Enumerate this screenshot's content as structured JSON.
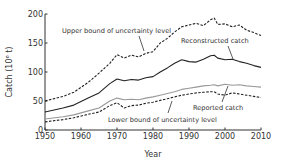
{
  "chart_data": {
    "type": "line",
    "title": "",
    "xlabel": "Year",
    "ylabel": "Catch (10⁶ t)",
    "xlim": [
      1950,
      2010
    ],
    "ylim": [
      0,
      200
    ],
    "x_ticks": [
      1950,
      1960,
      1970,
      1980,
      1990,
      2000,
      2010
    ],
    "y_ticks": [
      0,
      50,
      100,
      150,
      200
    ],
    "grid": false,
    "legend": "inline annotations",
    "series": [
      {
        "name": "Upper bound of uncertainty level",
        "style": "dashed",
        "color": "#222222",
        "x": [
          1950,
          1955,
          1958,
          1962,
          1965,
          1968,
          1970,
          1972,
          1974,
          1976,
          1978,
          1980,
          1982,
          1984,
          1986,
          1988,
          1990,
          1992,
          1994,
          1996,
          1997,
          1998,
          2000,
          2002,
          2004,
          2006,
          2008,
          2010
        ],
        "values": [
          50,
          58,
          65,
          82,
          98,
          115,
          130,
          124,
          129,
          126,
          132,
          135,
          150,
          158,
          169,
          178,
          181,
          184,
          180,
          190,
          193,
          182,
          183,
          178,
          181,
          172,
          168,
          163
        ]
      },
      {
        "name": "Reconstructed catch",
        "style": "solid",
        "color": "#222222",
        "x": [
          1950,
          1955,
          1958,
          1962,
          1965,
          1968,
          1970,
          1972,
          1974,
          1976,
          1978,
          1980,
          1982,
          1984,
          1986,
          1988,
          1990,
          1992,
          1994,
          1996,
          1997,
          1998,
          2000,
          2002,
          2004,
          2006,
          2008,
          2010
        ],
        "values": [
          31,
          38,
          43,
          55,
          64,
          80,
          88,
          85,
          87,
          86,
          90,
          92,
          100,
          107,
          115,
          121,
          118,
          117,
          122,
          128,
          129,
          124,
          121,
          122,
          118,
          115,
          111,
          108
        ]
      },
      {
        "name": "Reported catch",
        "style": "solid",
        "color": "#999999",
        "x": [
          1950,
          1955,
          1958,
          1962,
          1965,
          1968,
          1970,
          1972,
          1974,
          1976,
          1978,
          1980,
          1982,
          1984,
          1986,
          1988,
          1990,
          1992,
          1994,
          1996,
          1997,
          1998,
          2000,
          2002,
          2004,
          2006,
          2008,
          2010
        ],
        "values": [
          19,
          23,
          26,
          33,
          38,
          50,
          55,
          52,
          53,
          52,
          55,
          57,
          60,
          63,
          66,
          70,
          72,
          74,
          76,
          77,
          78,
          76,
          79,
          77,
          78,
          76,
          75,
          74
        ]
      },
      {
        "name": "Lower bound of uncertainty level",
        "style": "dashed",
        "color": "#222222",
        "x": [
          1950,
          1955,
          1958,
          1962,
          1965,
          1968,
          1970,
          1972,
          1974,
          1976,
          1978,
          1980,
          1982,
          1984,
          1986,
          1988,
          1990,
          1992,
          1994,
          1996,
          1997,
          1998,
          2000,
          2002,
          2004,
          2006,
          2008,
          2010
        ],
        "values": [
          14,
          18,
          21,
          27,
          31,
          42,
          47,
          38,
          42,
          43,
          46,
          48,
          51,
          54,
          57,
          60,
          62,
          64,
          65,
          66,
          66,
          62,
          60,
          64,
          62,
          60,
          58,
          56
        ]
      }
    ],
    "annotations": [
      {
        "text": "Upper bound of uncertainty level",
        "x": 62,
        "y": 33,
        "leader": [
          139,
          36,
          144,
          51
        ]
      },
      {
        "text": "Reconstructed catch",
        "x": 181,
        "y": 43,
        "leader": [
          228,
          46,
          233,
          59
        ]
      },
      {
        "text": "Reported catch",
        "x": 193,
        "y": 110,
        "leader": [
          222,
          102,
          228,
          86
        ]
      },
      {
        "text": "Lower bound of uncertainty level",
        "x": 108,
        "y": 122,
        "leader": [
          168,
          113,
          172,
          101
        ]
      }
    ]
  }
}
